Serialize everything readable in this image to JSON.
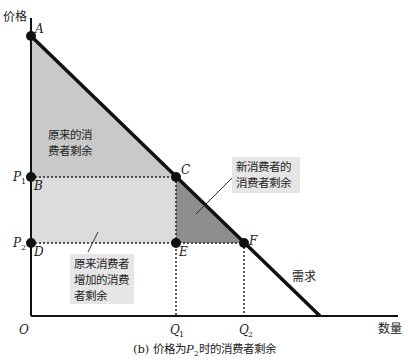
{
  "diagram": {
    "y_axis_label": "价格",
    "x_axis_label": "数量",
    "origin_label": "O",
    "caption_prefix": "(b) 价格为",
    "caption_var": "P",
    "caption_sub": "2",
    "caption_suffix": "时的消费者剩余",
    "demand_label": "需求",
    "points": {
      "A": "A",
      "B": "B",
      "C": "C",
      "D": "D",
      "E": "E",
      "F": "F"
    },
    "price_ticks": [
      {
        "var": "P",
        "sub": "1"
      },
      {
        "var": "P",
        "sub": "2"
      }
    ],
    "quantity_ticks": [
      {
        "var": "Q",
        "sub": "1"
      },
      {
        "var": "Q",
        "sub": "2"
      }
    ],
    "regions": {
      "original_cs": [
        "原来的消",
        "费者剩余"
      ],
      "new_consumers_cs": [
        "新消费者的",
        "消费者剩余"
      ],
      "added_cs_original": [
        "原来消费者",
        "增加的消费",
        "者剩余"
      ]
    },
    "colors": {
      "original_cs_fill": "#c9c9c9",
      "added_cs_fill": "#dcdcdc",
      "new_cs_fill": "#8e8e8e",
      "line": "#111111",
      "label_box": "#d9d9d9"
    }
  }
}
